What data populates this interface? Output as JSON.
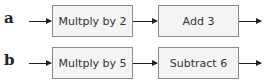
{
  "rows": [
    {
      "label": "a",
      "steps": [
        "Multply by 2",
        "Add 3"
      ]
    },
    {
      "label": "b",
      "steps": [
        "Multply by 5",
        "Subtract 6"
      ]
    }
  ]
}
